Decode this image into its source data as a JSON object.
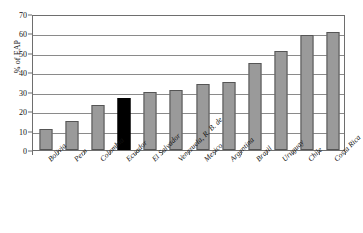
{
  "chart_data": {
    "type": "bar",
    "title": "",
    "xlabel": "",
    "ylabel": "% of EAP",
    "ylim": [
      0,
      70
    ],
    "ytick_step": 10,
    "yticks": [
      0,
      10,
      20,
      30,
      40,
      50,
      60,
      70
    ],
    "grid": true,
    "legend": "none",
    "categories": [
      "Bolivia",
      "Peru",
      "Colombia",
      "Ecuador",
      "El Salvador",
      "Venezuela, R. B. de",
      "Mexico",
      "Argentina",
      "Brazil",
      "Uruguay",
      "Chile",
      "Costa Rica"
    ],
    "values": [
      11,
      15,
      23,
      27,
      30,
      31,
      34,
      35,
      45,
      51,
      59,
      61
    ],
    "bar_colors": [
      "#9a9a9a",
      "#9a9a9a",
      "#9a9a9a",
      "#000000",
      "#9a9a9a",
      "#9a9a9a",
      "#9a9a9a",
      "#9a9a9a",
      "#9a9a9a",
      "#9a9a9a",
      "#9a9a9a",
      "#9a9a9a"
    ],
    "highlighted_category": "Ecuador",
    "colors": {
      "bar_default": "#9a9a9a",
      "bar_highlight": "#000000",
      "bar_border": "#555555",
      "gridline": "#8a8a8a",
      "axis": "#6e6e6e",
      "background": "#ffffff",
      "text": "#111111"
    }
  }
}
